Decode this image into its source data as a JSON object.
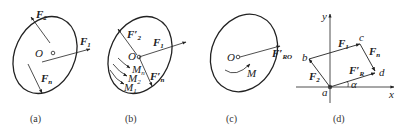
{
  "figures": [
    {
      "id": "a",
      "caption": "(a)",
      "labels": {
        "center": "O",
        "F2": "F",
        "F2_sub": "2",
        "F1": "F",
        "F1_sub": "1",
        "Fn": "F",
        "Fn_sub": "n"
      }
    },
    {
      "id": "b",
      "caption": "(b)",
      "labels": {
        "center": "O",
        "F2p": "F′",
        "F2p_sub": "2",
        "F1": "F",
        "F1_sub": "1",
        "Fnp": "F′",
        "Fnp_sub": "n",
        "Mn": "M",
        "Mn_sub": "n",
        "M2": "M",
        "M2_sub": "2",
        "M1": "M",
        "M1_sub": "1"
      }
    },
    {
      "id": "c",
      "caption": "(c)",
      "labels": {
        "center": "O",
        "FRO": "F′",
        "FRO_sub": "RO",
        "M": "M"
      }
    },
    {
      "id": "d",
      "caption": "(d)",
      "labels": {
        "y": "y",
        "x": "x",
        "a": "a",
        "b": "b",
        "c": "c",
        "d": "d",
        "alpha": "α",
        "F1": "F",
        "F1_sub": "1",
        "F2": "F",
        "F2_sub": "2",
        "Fn": "F",
        "Fn_sub": "n",
        "FR": "F′",
        "FR_sub": "R"
      }
    }
  ]
}
